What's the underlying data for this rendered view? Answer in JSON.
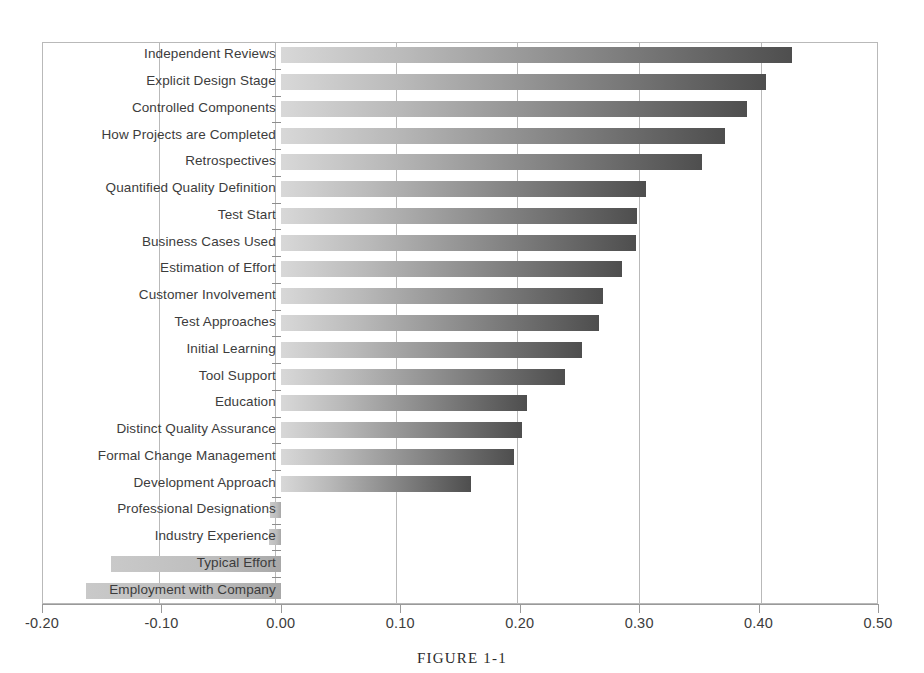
{
  "figure": {
    "caption": "FIGURE 1-1"
  },
  "chart_data": {
    "type": "bar",
    "orientation": "horizontal",
    "title": "",
    "xlabel": "",
    "ylabel": "",
    "xlim": [
      -0.2,
      0.5
    ],
    "xticks": [
      "-0.20",
      "-0.10",
      "0.00",
      "0.10",
      "0.20",
      "0.30",
      "0.40",
      "0.50"
    ],
    "xtick_values": [
      -0.2,
      -0.1,
      0.0,
      0.1,
      0.2,
      0.3,
      0.4,
      0.5
    ],
    "grid": true,
    "grid_axis": "x",
    "legend": "none",
    "bar_style": "horizontal-gradient-light-to-dark",
    "categories": [
      "Independent Reviews",
      "Explicit Design Stage",
      "Controlled Components",
      "How Projects are Completed",
      "Retrospectives",
      "Quantified Quality Definition",
      "Test Start",
      "Business Cases Used",
      "Estimation of Effort",
      "Customer Involvement",
      "Test Approaches",
      "Initial Learning",
      "Tool Support",
      "Education",
      "Distinct Quality Assurance",
      "Formal Change Management",
      "Development Approach",
      "Professional Designations",
      "Industry Experience",
      "Typical Effort",
      "Employment with Company"
    ],
    "values": [
      0.428,
      0.406,
      0.39,
      0.372,
      0.353,
      0.306,
      0.298,
      0.297,
      0.286,
      0.27,
      0.266,
      0.252,
      0.238,
      0.206,
      0.202,
      0.195,
      0.159,
      -0.009,
      -0.01,
      -0.142,
      -0.163
    ]
  }
}
